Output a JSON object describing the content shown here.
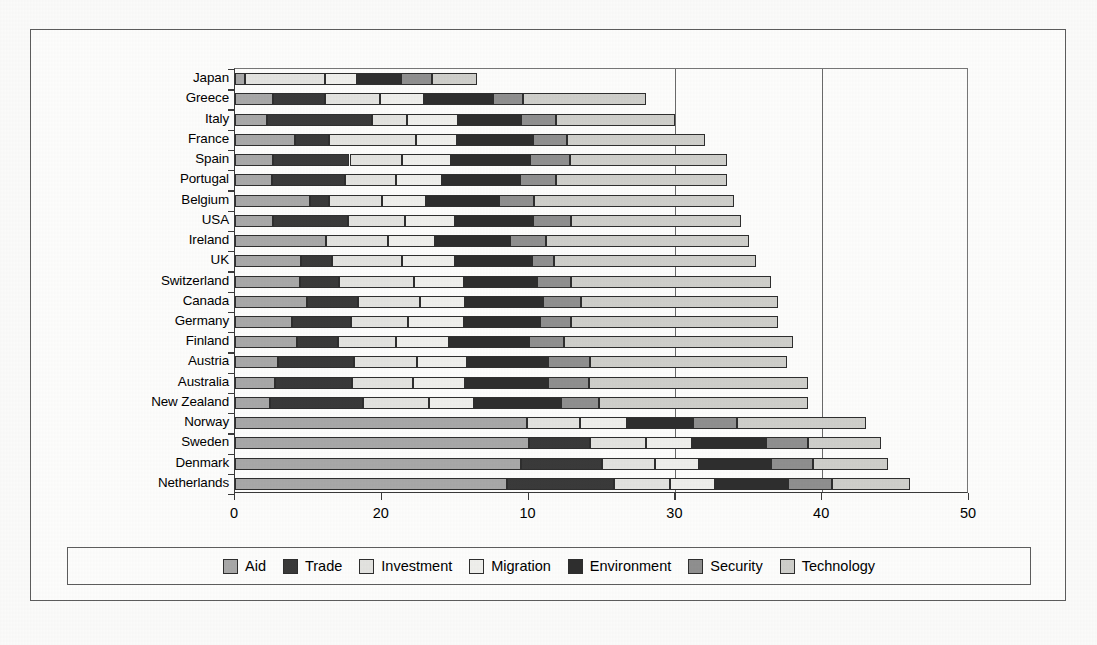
{
  "chart_data": {
    "type": "bar",
    "orientation": "horizontal",
    "stacked": true,
    "title": "",
    "subtitle": "",
    "xlabel": "",
    "ylabel": "",
    "xlim": [
      0,
      50
    ],
    "xticks": [
      0,
      10,
      20,
      30,
      40,
      50
    ],
    "xticklabels": [
      "0",
      "20",
      "10",
      "30",
      "40",
      "50"
    ],
    "gridlines": [
      30,
      40
    ],
    "grid": true,
    "legend_position": "bottom",
    "legend": [
      "Aid",
      "Trade",
      "Investment",
      "Migration",
      "Environment",
      "Security",
      "Technology"
    ],
    "series_colors": [
      "#a8a8a8",
      "#3a3a3a",
      "#e3e3e0",
      "#efefec",
      "#2e2e2e",
      "#8f8f8f",
      "#cfcfcb"
    ],
    "categories": [
      "Japan",
      "Greece",
      "Italy",
      "France",
      "Spain",
      "Portugal",
      "Belgium",
      "USA",
      "Ireland",
      "UK",
      "Switzerland",
      "Canada",
      "Germany",
      "Finland",
      "Austria",
      "Australia",
      "New Zealand",
      "Norway",
      "Sweden",
      "Denmark",
      "Netherlands"
    ],
    "series": [
      {
        "name": "Aid",
        "values": [
          0.7,
          2.6,
          2.2,
          4.1,
          2.6,
          2.5,
          5.1,
          2.6,
          6.2,
          4.5,
          4.4,
          4.9,
          3.9,
          4.2,
          2.9,
          2.7,
          2.4,
          19.9,
          20.0,
          19.5,
          18.5
        ]
      },
      {
        "name": "Trade",
        "values": [
          0.0,
          3.5,
          7.1,
          2.3,
          5.2,
          5.0,
          1.3,
          5.1,
          0.0,
          2.1,
          2.7,
          3.5,
          4.0,
          2.8,
          5.2,
          5.3,
          6.3,
          0.0,
          4.2,
          5.5,
          7.3
        ]
      },
      {
        "name": "Investment",
        "values": [
          5.4,
          3.8,
          2.4,
          5.9,
          3.6,
          3.5,
          3.6,
          3.9,
          4.2,
          4.8,
          5.1,
          4.2,
          3.9,
          4.0,
          4.3,
          4.1,
          4.5,
          3.6,
          3.8,
          3.6,
          3.8
        ]
      },
      {
        "name": "Migration",
        "values": [
          2.2,
          3.0,
          3.5,
          2.8,
          3.3,
          3.1,
          3.0,
          3.4,
          3.2,
          3.6,
          3.4,
          3.1,
          3.8,
          3.6,
          3.4,
          3.6,
          3.1,
          3.2,
          3.1,
          3.0,
          3.1
        ]
      },
      {
        "name": "Environment",
        "values": [
          3.0,
          4.7,
          4.3,
          5.2,
          5.4,
          5.3,
          5.0,
          5.3,
          5.1,
          5.2,
          5.0,
          5.3,
          5.2,
          5.4,
          5.5,
          5.6,
          5.9,
          4.5,
          5.1,
          4.9,
          5.0
        ]
      },
      {
        "name": "Security",
        "values": [
          2.1,
          2.0,
          2.4,
          2.3,
          2.7,
          2.5,
          2.4,
          2.6,
          2.5,
          1.5,
          2.3,
          2.6,
          2.1,
          2.4,
          2.9,
          2.8,
          2.6,
          3.0,
          2.8,
          2.9,
          3.0
        ]
      },
      {
        "name": "Technology",
        "values": [
          3.1,
          8.4,
          8.1,
          9.4,
          10.7,
          11.6,
          13.6,
          11.6,
          13.8,
          13.8,
          13.6,
          13.4,
          14.1,
          15.6,
          13.4,
          14.9,
          14.2,
          8.8,
          5.0,
          5.1,
          5.3
        ]
      }
    ],
    "totals": [
      16.5,
      28.0,
      30.0,
      32.0,
      33.5,
      33.5,
      34.0,
      34.5,
      35.0,
      35.5,
      36.5,
      37.0,
      37.0,
      38.0,
      37.6,
      39.0,
      39.0,
      43.0,
      44.0,
      44.5,
      46.0
    ]
  }
}
